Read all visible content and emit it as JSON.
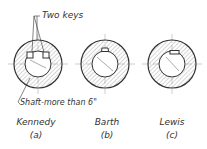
{
  "figure": {
    "callouts": {
      "keys": "Two keys",
      "shaft": "Shaft-more than 6\""
    },
    "items": [
      {
        "name": "Kennedy",
        "letter": "(a)"
      },
      {
        "name": "Barth",
        "letter": "(b)"
      },
      {
        "name": "Lewis",
        "letter": "(c)"
      }
    ],
    "colors": {
      "line": "#333333",
      "hatch": "#777777",
      "background": "#ffffff"
    }
  }
}
